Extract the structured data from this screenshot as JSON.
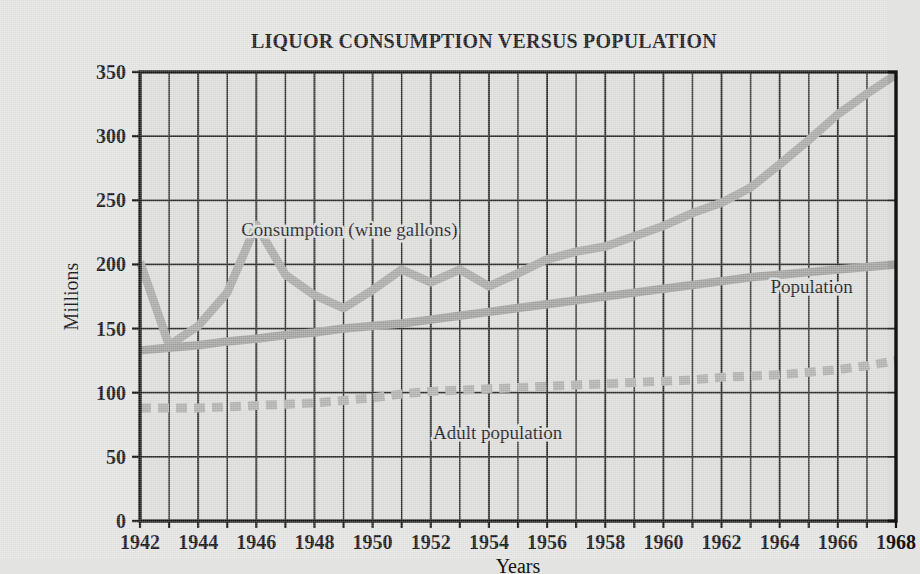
{
  "chart_data": {
    "type": "line",
    "title": "LIQUOR CONSUMPTION VERSUS POPULATION",
    "xlabel": "Years",
    "ylabel": "Millions",
    "xlim": [
      1942,
      1968
    ],
    "ylim": [
      0,
      350
    ],
    "ytick_labels": [
      "0",
      "50",
      "100",
      "150",
      "200",
      "250",
      "300",
      "350"
    ],
    "yticks": [
      0,
      50,
      100,
      150,
      200,
      250,
      300,
      350
    ],
    "xtick_labels": [
      "1942",
      "1944",
      "1946",
      "1948",
      "1950",
      "1952",
      "1954",
      "1956",
      "1958",
      "1960",
      "1962",
      "1964",
      "1966",
      "1968"
    ],
    "xticks": [
      1942,
      1944,
      1946,
      1948,
      1950,
      1952,
      1954,
      1956,
      1958,
      1960,
      1962,
      1964,
      1966,
      1968
    ],
    "grid": "vertical gridlines every 1 year; horizontal gridlines every 50 million",
    "legend_position": "inline annotations on plot",
    "x": [
      1942,
      1943,
      1944,
      1945,
      1946,
      1947,
      1948,
      1949,
      1950,
      1951,
      1952,
      1953,
      1954,
      1955,
      1956,
      1957,
      1958,
      1959,
      1960,
      1961,
      1962,
      1963,
      1964,
      1965,
      1966,
      1967,
      1968
    ],
    "series": [
      {
        "name": "Consumption (wine gallons)",
        "style": "solid thick gray",
        "color": "#a9a9a7",
        "values": [
          202,
          137,
          152,
          178,
          231,
          192,
          176,
          166,
          180,
          196,
          186,
          196,
          183,
          193,
          204,
          210,
          214,
          222,
          230,
          240,
          248,
          260,
          278,
          297,
          317,
          333,
          348
        ]
      },
      {
        "name": "Population",
        "style": "solid thick gray",
        "color": "#a1a19f",
        "values": [
          133,
          135,
          137,
          140,
          142,
          145,
          147,
          150,
          152,
          154,
          157,
          160,
          163,
          166,
          169,
          172,
          175,
          178,
          181,
          184,
          187,
          190,
          192,
          194,
          196,
          198,
          200
        ]
      },
      {
        "name": "Adult population",
        "style": "dashed thick gray",
        "color": "#b0b0ae",
        "values": [
          88,
          88,
          88,
          89,
          90,
          91,
          92,
          94,
          96,
          99,
          101,
          102,
          103,
          104,
          105,
          106,
          107,
          108,
          109,
          110,
          112,
          113,
          114,
          116,
          118,
          121,
          125
        ]
      }
    ],
    "annotations": [
      {
        "text": "Consumption (wine gallons)",
        "x": 1949.2,
        "y": 222
      },
      {
        "text": "Population",
        "x": 1965.1,
        "y": 178
      },
      {
        "text": "Adult population",
        "x": 1954.3,
        "y": 64
      }
    ]
  },
  "colors": {
    "background": "#e3e3e1",
    "plot_background": "#dcdcda",
    "axis": "#131313",
    "gridline": "#2b2b2b",
    "consumption_line": "#a9a9a7",
    "population_line": "#a1a19f",
    "adult_population_line": "#b0b0ae",
    "text": "#131313"
  }
}
